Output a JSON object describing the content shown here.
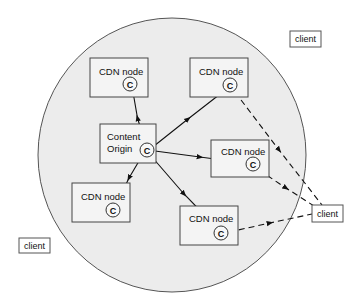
{
  "diagram": {
    "type": "CDN content distribution",
    "colors": {
      "background": "#ffffff",
      "network_fill": "#ececec",
      "network_stroke": "#555555",
      "box_fill": "#f4f4f4",
      "box_stroke": "#444444",
      "line": "#111111"
    },
    "network_boundary": {
      "cx": 172,
      "cy": 155,
      "rx": 134,
      "ry": 137
    },
    "origin": {
      "label_line1": "Content",
      "label_line2": "Origin",
      "cache_label": "C",
      "box": {
        "x": 100,
        "y": 124,
        "w": 56,
        "h": 39
      },
      "cache": {
        "cx": 147,
        "cy": 150
      }
    },
    "cdn_nodes": [
      {
        "id": "top-left",
        "label": "CDN node",
        "cache_label": "C",
        "box": {
          "x": 90,
          "y": 58,
          "w": 58,
          "h": 39
        },
        "cache": {
          "cx": 130,
          "cy": 84
        }
      },
      {
        "id": "top-right",
        "label": "CDN node",
        "cache_label": "C",
        "box": {
          "x": 190,
          "y": 58,
          "w": 58,
          "h": 39
        },
        "cache": {
          "cx": 230,
          "cy": 85
        }
      },
      {
        "id": "middle-right",
        "label": "CDN node",
        "cache_label": "C",
        "box": {
          "x": 211,
          "y": 140,
          "w": 58,
          "h": 37
        },
        "cache": {
          "cx": 253,
          "cy": 164
        }
      },
      {
        "id": "bottom-left",
        "label": "CDN node",
        "cache_label": "C",
        "box": {
          "x": 72,
          "y": 183,
          "w": 58,
          "h": 39
        },
        "cache": {
          "cx": 113,
          "cy": 210
        }
      },
      {
        "id": "bottom-center",
        "label": "CDN node",
        "cache_label": "C",
        "box": {
          "x": 180,
          "y": 206,
          "w": 58,
          "h": 39
        },
        "cache": {
          "cx": 221,
          "cy": 233
        }
      }
    ],
    "clients": [
      {
        "id": "top-right",
        "label": "client",
        "box": {
          "x": 290,
          "y": 31,
          "w": 31,
          "h": 16
        }
      },
      {
        "id": "right",
        "label": "client",
        "box": {
          "x": 312,
          "y": 205,
          "w": 31,
          "h": 17
        }
      },
      {
        "id": "bottom-left",
        "label": "client",
        "box": {
          "x": 19,
          "y": 238,
          "w": 31,
          "h": 15
        }
      }
    ],
    "distribution_edges": [
      {
        "from": "origin",
        "to": "top-left",
        "style": "solid"
      },
      {
        "from": "origin",
        "to": "top-right",
        "style": "solid"
      },
      {
        "from": "origin",
        "to": "middle-right",
        "style": "solid"
      },
      {
        "from": "origin",
        "to": "bottom-left",
        "style": "solid"
      },
      {
        "from": "origin",
        "to": "bottom-center",
        "style": "solid"
      }
    ],
    "delivery_edges": [
      {
        "from": "top-right",
        "to": "client-right",
        "style": "dashed"
      },
      {
        "from": "middle-right",
        "to": "client-right",
        "style": "dashed"
      },
      {
        "from": "bottom-center",
        "to": "client-right",
        "style": "dashed"
      }
    ]
  }
}
